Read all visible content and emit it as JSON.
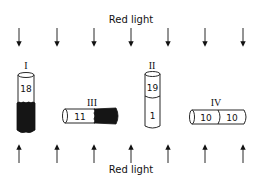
{
  "diagram": {
    "top_label": "Red light",
    "bottom_label": "Red light",
    "arrow_x": [
      19,
      57,
      94,
      131,
      168,
      205,
      243
    ],
    "tubes": [
      {
        "id": "I",
        "label": "I",
        "orientation": "vertical",
        "segments": [
          {
            "text": "18",
            "dark": false
          },
          {
            "text": "",
            "dark": true
          }
        ]
      },
      {
        "id": "II",
        "label": "II",
        "orientation": "vertical",
        "segments": [
          {
            "text": "19",
            "dark": false
          },
          {
            "text": "1",
            "dark": false
          }
        ]
      },
      {
        "id": "III",
        "label": "III",
        "orientation": "horizontal",
        "segments": [
          {
            "text": "11",
            "dark": false
          },
          {
            "text": "",
            "dark": true
          }
        ]
      },
      {
        "id": "IV",
        "label": "IV",
        "orientation": "horizontal",
        "segments": [
          {
            "text": "10",
            "dark": false
          },
          {
            "text": "10",
            "dark": false
          }
        ]
      }
    ],
    "colors": {
      "ink": "#111111",
      "dark_fill": "#151515",
      "background": "#ffffff"
    }
  }
}
